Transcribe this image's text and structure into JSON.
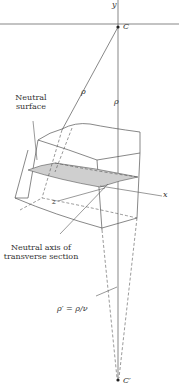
{
  "figure": {
    "type": "geometry diagram",
    "colors": {
      "line": "#555555",
      "shaded_surface": "#cfcfcf",
      "background": "#ffffff",
      "text": "#333333"
    }
  },
  "labels": {
    "y_axis": "y",
    "x_axis": "x",
    "z_axis": "z",
    "center_C": "C",
    "center_C_prime": "C′",
    "rho_slanted": "ρ",
    "rho_vertical": "ρ",
    "neutral_surface_line1": "Neutral",
    "neutral_surface_line2": "surface",
    "neutral_axis_line1": "Neutral axis of",
    "neutral_axis_line2": "transverse section",
    "rho_prime_relation": "ρ′ = ρ/ν"
  }
}
